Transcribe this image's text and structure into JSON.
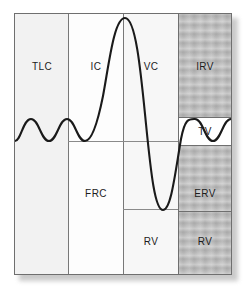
{
  "figure": {
    "background_color": "#ffffff",
    "plate_border_color": "#6f6f6f",
    "shaded_column_color": "#bdbdbd",
    "trace_color": "#1a1a1a"
  },
  "columns": [
    {
      "key": "tlc",
      "label": "TLC",
      "shaded": "false"
    },
    {
      "key": "ic",
      "label": "IC",
      "shaded": "false"
    },
    {
      "key": "vc",
      "label": "VC",
      "shaded": "false"
    },
    {
      "key": "irv",
      "label": "IRV",
      "shaded": "true"
    }
  ],
  "labels": {
    "tlc": "TLC",
    "ic": "IC",
    "vc": "VC",
    "irv": "IRV",
    "frc": "FRC",
    "tv": "TV",
    "erv": "ERV",
    "rv_middle": "RV",
    "rv_right": "RV"
  },
  "chart_data": {
    "type": "line",
    "xlabel": "",
    "ylabel": "",
    "grid": "false",
    "legend_position": "none",
    "xlim": [
      0,
      216
    ],
    "ylim": [
      0,
      260
    ],
    "y_axis_direction": "inverted-pixel",
    "reference_levels": {
      "total_lung_capacity_top": 4,
      "tidal_peak": 105,
      "functional_residual_capacity": 127,
      "tidal_trough_band_bottom": 132,
      "residual_volume": 196,
      "plate_bottom": 260
    },
    "annotations": [
      {
        "text": "TLC",
        "region": "column-1",
        "meaning": "Total Lung Capacity"
      },
      {
        "text": "IC",
        "region": "column-2",
        "meaning": "Inspiratory Capacity"
      },
      {
        "text": "VC",
        "region": "column-3",
        "meaning": "Vital Capacity"
      },
      {
        "text": "IRV",
        "region": "column-4",
        "meaning": "Inspiratory Reserve Volume"
      },
      {
        "text": "FRC",
        "region": "column-2-lower",
        "meaning": "Functional Residual Capacity"
      },
      {
        "text": "TV",
        "region": "column-4-band",
        "meaning": "Tidal Volume"
      },
      {
        "text": "ERV",
        "region": "column-4-lower",
        "meaning": "Expiratory Reserve Volume"
      },
      {
        "text": "RV",
        "region": "column-3-bottom",
        "meaning": "Residual Volume"
      },
      {
        "text": "RV",
        "region": "column-4-bottom",
        "meaning": "Residual Volume"
      }
    ],
    "series": [
      {
        "name": "spirogram",
        "description": "Tidal breathing, maximal inspiration to TLC, maximal expiration to RV, return to tidal breathing",
        "path": "M 0,127 C 6,127 8,105 16,105 C 24,105 26,127 34,127 C 42,127 44,105 52,105 C 60,105 62,127 70,127 C 76,127 82,112 88,82 C 94,50 99,4 110,4 C 121,4 126,60 131,110 C 136,160 140,196 148,196 C 156,196 160,160 166,125 C 170,104 174,105 180,105 C 188,105 190,127 198,127 C 206,127 208,105 216,105"
      }
    ]
  }
}
